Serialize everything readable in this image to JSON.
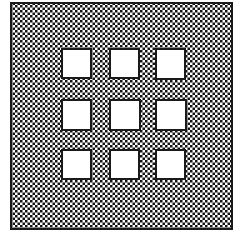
{
  "figure": {
    "type": "technical-line-drawing",
    "caption": "",
    "canvas": {
      "width": 243,
      "height": 240,
      "background_color": "#FFFFFF"
    },
    "plate": {
      "name": "hatched-plate",
      "x": 11,
      "y": 3,
      "width": 221,
      "height": 226,
      "outline_color": "#1A1A1A",
      "outline_width": 2,
      "fill_pattern": "checkerboard-dither",
      "pattern_cell_px": 2.5,
      "pattern_dark_color": "#141414",
      "pattern_light_color": "#FFFFFF"
    },
    "apertures": {
      "name": "square-aperture-grid",
      "rows": 3,
      "columns": 3,
      "count": 9,
      "fill_color": "#FFFFFF",
      "outline_color": "#1A1A1A",
      "outline_width": 2,
      "size": 29,
      "column_x": [
        62,
        110,
        156
      ],
      "row_y": [
        49,
        100,
        150
      ],
      "items": [
        {
          "id": "aperture-r1c1",
          "row": 1,
          "col": 1,
          "x": 62,
          "y": 49,
          "w": 29,
          "h": 29
        },
        {
          "id": "aperture-r1c2",
          "row": 1,
          "col": 2,
          "x": 110,
          "y": 49,
          "w": 29,
          "h": 29
        },
        {
          "id": "aperture-r1c3",
          "row": 1,
          "col": 3,
          "x": 156,
          "y": 49,
          "w": 29,
          "h": 30
        },
        {
          "id": "aperture-r2c1",
          "row": 2,
          "col": 1,
          "x": 62,
          "y": 100,
          "w": 29,
          "h": 30
        },
        {
          "id": "aperture-r2c2",
          "row": 2,
          "col": 2,
          "x": 110,
          "y": 100,
          "w": 30,
          "h": 30
        },
        {
          "id": "aperture-r2c3",
          "row": 2,
          "col": 3,
          "x": 156,
          "y": 100,
          "w": 30,
          "h": 30
        },
        {
          "id": "aperture-r3c1",
          "row": 3,
          "col": 1,
          "x": 62,
          "y": 150,
          "w": 29,
          "h": 29
        },
        {
          "id": "aperture-r3c2",
          "row": 3,
          "col": 2,
          "x": 110,
          "y": 150,
          "w": 29,
          "h": 29
        },
        {
          "id": "aperture-r3c3",
          "row": 3,
          "col": 3,
          "x": 156,
          "y": 150,
          "w": 29,
          "h": 29
        }
      ]
    }
  }
}
